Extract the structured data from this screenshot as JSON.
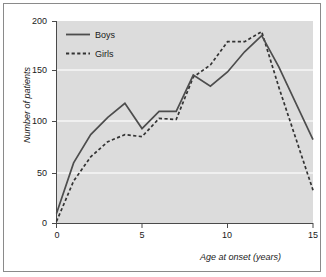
{
  "chart_data": {
    "type": "line",
    "title": "",
    "subtitle": "",
    "xlabel": "Age at onset (years)",
    "ylabel": "Number of patients",
    "xlim": [
      0,
      15
    ],
    "ylim": [
      0,
      200
    ],
    "xticks": [
      "0",
      "5",
      "10",
      "15"
    ],
    "yticks": [
      "0",
      "50",
      "100",
      "150",
      "200"
    ],
    "grid": "horizontal",
    "plot_background": "#dcdcdc",
    "gridline_color": "#f7f7f7",
    "legend_position": "top-left-inside",
    "x": [
      0,
      1,
      2,
      3,
      4,
      5,
      6,
      7,
      8,
      9,
      10,
      11,
      12,
      13,
      15
    ],
    "series": [
      {
        "name": "Boys",
        "style": "solid",
        "color": "#4d4d4d",
        "values": [
          10,
          60,
          88,
          105,
          119,
          94,
          111,
          111,
          147,
          136,
          150,
          170,
          186,
          155,
          83
        ]
      },
      {
        "name": "Girls",
        "style": "dashed",
        "color": "#333333",
        "values": [
          2,
          42,
          66,
          81,
          88,
          86,
          104,
          103,
          145,
          157,
          180,
          180,
          190,
          135,
          33
        ]
      }
    ]
  },
  "legend": {
    "entries": [
      {
        "label": "Boys"
      },
      {
        "label": "Girls"
      }
    ]
  },
  "axes": {
    "y_tick_labels": [
      "200",
      "150",
      "100",
      "50",
      "0"
    ],
    "x_tick_labels": [
      "0",
      "5",
      "10",
      "15"
    ],
    "y_title": "Number of patients",
    "x_title": "Age at onset (years)"
  }
}
